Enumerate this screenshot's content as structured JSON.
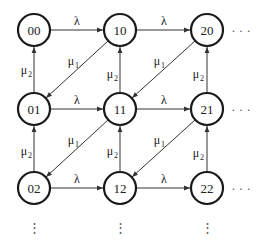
{
  "diagram": {
    "type": "state-transition",
    "nodes": [
      {
        "id": "00",
        "label": "00",
        "x": 34,
        "y": 30
      },
      {
        "id": "10",
        "label": "10",
        "x": 120,
        "y": 30
      },
      {
        "id": "20",
        "label": "20",
        "x": 207,
        "y": 30
      },
      {
        "id": "01",
        "label": "01",
        "x": 34,
        "y": 109
      },
      {
        "id": "11",
        "label": "11",
        "x": 120,
        "y": 109
      },
      {
        "id": "21",
        "label": "21",
        "x": 207,
        "y": 109
      },
      {
        "id": "02",
        "label": "02",
        "x": 34,
        "y": 188
      },
      {
        "id": "12",
        "label": "12",
        "x": 120,
        "y": 188
      },
      {
        "id": "22",
        "label": "22",
        "x": 207,
        "y": 188
      }
    ],
    "edges": [
      {
        "from": "00",
        "to": "10",
        "label": "λ",
        "sub": ""
      },
      {
        "from": "10",
        "to": "20",
        "label": "λ",
        "sub": ""
      },
      {
        "from": "01",
        "to": "11",
        "label": "λ",
        "sub": ""
      },
      {
        "from": "11",
        "to": "21",
        "label": "λ",
        "sub": ""
      },
      {
        "from": "02",
        "to": "12",
        "label": "λ",
        "sub": ""
      },
      {
        "from": "12",
        "to": "22",
        "label": "λ",
        "sub": ""
      },
      {
        "from": "01",
        "to": "00",
        "label": "μ",
        "sub": "2"
      },
      {
        "from": "11",
        "to": "10",
        "label": "μ",
        "sub": "2"
      },
      {
        "from": "21",
        "to": "20",
        "label": "μ",
        "sub": "2"
      },
      {
        "from": "02",
        "to": "01",
        "label": "μ",
        "sub": "2"
      },
      {
        "from": "12",
        "to": "11",
        "label": "μ",
        "sub": "2"
      },
      {
        "from": "22",
        "to": "21",
        "label": "μ",
        "sub": "2"
      },
      {
        "from": "10",
        "to": "01",
        "label": "μ",
        "sub": "1"
      },
      {
        "from": "20",
        "to": "11",
        "label": "μ",
        "sub": "1"
      },
      {
        "from": "11",
        "to": "02",
        "label": "μ",
        "sub": "1"
      },
      {
        "from": "21",
        "to": "12",
        "label": "μ",
        "sub": "1"
      }
    ],
    "continuation": {
      "horizontal": "· · ·",
      "vertical": "⋮"
    }
  },
  "labels": {
    "lambda": "λ",
    "mu": "μ",
    "sub1": "1",
    "sub2": "2",
    "hdots": "· · ·",
    "vdots": "⋮"
  },
  "colors": {
    "stroke": "#1a1a1a",
    "text": "#222222",
    "background": "#ffffff"
  }
}
